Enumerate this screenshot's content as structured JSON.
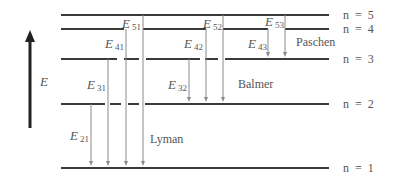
{
  "axis": {
    "label": "E",
    "x": 30,
    "y_top": 30,
    "y_bottom": 128,
    "label_x": 40,
    "label_y": 86
  },
  "levels": [
    {
      "n": 5,
      "label": "n  =  5",
      "y": 15,
      "segments": [
        [
          61,
          329
        ]
      ]
    },
    {
      "n": 4,
      "label": "n  =  4",
      "y": 29,
      "segments": [
        [
          61,
          124
        ],
        [
          143,
          206
        ],
        [
          223,
          268
        ],
        [
          285,
          329
        ]
      ]
    },
    {
      "n": 3,
      "label": "n  =  3",
      "y": 59,
      "segments": [
        [
          61,
          117
        ],
        [
          124,
          139
        ],
        [
          146,
          200
        ],
        [
          205,
          218
        ],
        [
          225,
          329
        ]
      ]
    },
    {
      "n": 2,
      "label": "n  =  2",
      "y": 104,
      "segments": [
        [
          61,
          105
        ],
        [
          110,
          121
        ],
        [
          128,
          139
        ],
        [
          145,
          329
        ]
      ]
    },
    {
      "n": 1,
      "label": "n  =  1",
      "y": 168,
      "segments": [
        [
          61,
          329
        ]
      ]
    }
  ],
  "level_label_x": 343,
  "series": [
    {
      "name": "Lyman",
      "label_x": 150,
      "label_y": 143,
      "target_n": 1
    },
    {
      "name": "Balmer",
      "label_x": 238,
      "label_y": 88,
      "target_n": 2
    },
    {
      "name": "Paschen",
      "label_x": 296,
      "label_y": 46,
      "target_n": 3
    }
  ],
  "transitions": [
    {
      "id": "E21",
      "main": "E",
      "sub": "21",
      "from": 2,
      "to": 1,
      "x": 91,
      "label_x": 70,
      "label_y": 140
    },
    {
      "id": "E31",
      "main": "E",
      "sub": "31",
      "from": 3,
      "to": 1,
      "x": 108,
      "label_x": 87,
      "label_y": 89
    },
    {
      "id": "E41",
      "main": "E",
      "sub": "41",
      "from": 4,
      "to": 1,
      "x": 126,
      "label_x": 105,
      "label_y": 48
    },
    {
      "id": "E51",
      "main": "E",
      "sub": "51",
      "from": 5,
      "to": 1,
      "x": 143,
      "label_x": 122,
      "label_y": 28
    },
    {
      "id": "E32",
      "main": "E",
      "sub": "32",
      "from": 3,
      "to": 2,
      "x": 189,
      "label_x": 168,
      "label_y": 89
    },
    {
      "id": "E42",
      "main": "E",
      "sub": "42",
      "from": 4,
      "to": 2,
      "x": 206,
      "label_x": 184,
      "label_y": 48
    },
    {
      "id": "E52",
      "main": "E",
      "sub": "52",
      "from": 5,
      "to": 2,
      "x": 223,
      "label_x": 203,
      "label_y": 28
    },
    {
      "id": "E43",
      "main": "E",
      "sub": "43",
      "from": 4,
      "to": 3,
      "x": 268,
      "label_x": 248,
      "label_y": 48
    },
    {
      "id": "E53",
      "main": "E",
      "sub": "53",
      "from": 5,
      "to": 3,
      "x": 285,
      "label_x": 265,
      "label_y": 26
    }
  ],
  "colors": {
    "level_line": "#3a3a3a",
    "transition_line": "#8a8a8a",
    "axis": "#222222",
    "text": "#555555"
  }
}
